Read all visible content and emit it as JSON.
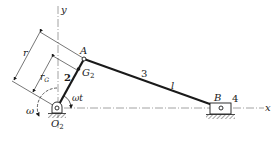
{
  "diagram": {
    "type": "slider-crank mechanism",
    "labels": {
      "y_axis": "y",
      "x_axis": "x",
      "point_A": "A",
      "point_B": "B",
      "point_O2": "O",
      "point_O2_sub": "2",
      "point_G2": "G",
      "point_G2_sub": "2",
      "link_crank": "2",
      "link_coupler": "3",
      "link_slider": "4",
      "coupler_length": "l",
      "crank_length": "r",
      "cg_distance": "r",
      "cg_distance_sub": "G",
      "angular_velocity": "ω",
      "crank_angle": "ωt"
    },
    "colors": {
      "ink": "#1a1a1a",
      "axis": "#8a8a8a",
      "background": "#ffffff"
    }
  }
}
